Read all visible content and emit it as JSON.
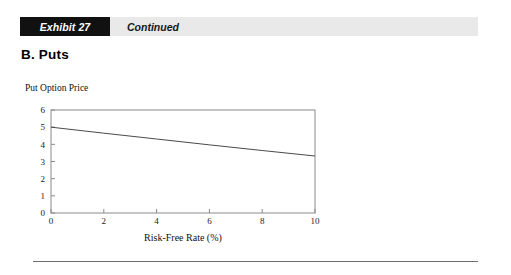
{
  "header": {
    "exhibit_label": "Exhibit 27",
    "continued_label": "Continued",
    "tag_bg_color": "#111111",
    "bar_bg_color": "#e9e9e9"
  },
  "section": {
    "heading": "B.  Puts"
  },
  "chart_data": {
    "type": "line",
    "title": "",
    "ylabel": "Put Option Price",
    "xlabel": "Risk-Free Rate (%)",
    "xlim": [
      0,
      10
    ],
    "ylim": [
      0,
      6
    ],
    "xticks": [
      "0",
      "2",
      "4",
      "6",
      "8",
      "10"
    ],
    "xtick_values": [
      0,
      2,
      4,
      6,
      8,
      10
    ],
    "yticks": [
      "0",
      "1",
      "2",
      "3",
      "4",
      "5",
      "6"
    ],
    "ytick_values": [
      0,
      1,
      2,
      3,
      4,
      5,
      6
    ],
    "grid": false,
    "legend": "none",
    "line_color": "#4a4a4a",
    "series": [
      {
        "name": "Put Option Price",
        "x": [
          0,
          2,
          4,
          6,
          8,
          10
        ],
        "values": [
          5.0,
          4.65,
          4.31,
          3.97,
          3.64,
          3.32
        ]
      }
    ]
  },
  "footer": {
    "rule_color": "#6f6f6f"
  }
}
